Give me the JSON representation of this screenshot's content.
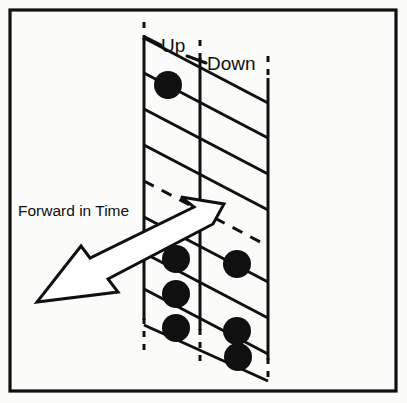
{
  "figure": {
    "name": "spin-network-forward-in-time-diagram",
    "background_color": "#fbfbf9",
    "ink_color": "#101010",
    "frame": {
      "label": "outer-border",
      "x": 10,
      "y": 10,
      "width": 386,
      "height": 381,
      "stroke_width": 3.2
    },
    "labels": {
      "up": "Up",
      "down": "Down",
      "forward_in_time": "Forward in Time"
    },
    "label_positions": {
      "up": {
        "x": 161,
        "y": 52,
        "font_size": 19
      },
      "down": {
        "x": 207,
        "y": 70,
        "font_size": 19
      },
      "forward_in_time": {
        "x": 18,
        "y": 216,
        "font_size": 15
      }
    },
    "leader_lines": [
      {
        "name": "up-leader",
        "x1": 160,
        "y1": 44,
        "x2": 145,
        "y2": 38
      },
      {
        "name": "down-leader",
        "x1": 205,
        "y1": 62,
        "x2": 186,
        "y2": 56
      }
    ],
    "vertical_lines": [
      {
        "name": "vertical-line-left",
        "x": 144,
        "dash_top": {
          "y1": 22,
          "y2": 38
        },
        "solid": {
          "y1": 38,
          "y2": 320
        },
        "dash_bottom": {
          "y1": 320,
          "y2": 350
        }
      },
      {
        "name": "vertical-line-middle",
        "x": 200,
        "dash_top": {
          "y1": 40,
          "y2": 58
        },
        "solid": {
          "y1": 58,
          "y2": 330
        },
        "dash_bottom": {
          "y1": 330,
          "y2": 367
        }
      },
      {
        "name": "vertical-line-right",
        "x": 268,
        "dash_top": {
          "y1": 56,
          "y2": 78
        },
        "solid": {
          "y1": 78,
          "y2": 360
        },
        "dash_bottom": {
          "y1": 360,
          "y2": 381
        }
      }
    ],
    "diagonal_lines": [
      {
        "name": "diagonal-1",
        "x1": 144,
        "y1": 38,
        "x2": 268,
        "y2": 103,
        "style": "solid"
      },
      {
        "name": "diagonal-2",
        "x1": 144,
        "y1": 73,
        "x2": 268,
        "y2": 138,
        "style": "solid"
      },
      {
        "name": "diagonal-3",
        "x1": 144,
        "y1": 109,
        "x2": 268,
        "y2": 174,
        "style": "solid"
      },
      {
        "name": "diagonal-4",
        "x1": 144,
        "y1": 145,
        "x2": 268,
        "y2": 210,
        "style": "solid"
      },
      {
        "name": "diagonal-5",
        "x1": 144,
        "y1": 181,
        "x2": 268,
        "y2": 246,
        "style": "dashed"
      },
      {
        "name": "diagonal-6",
        "x1": 144,
        "y1": 217,
        "x2": 268,
        "y2": 282,
        "style": "solid"
      },
      {
        "name": "diagonal-7",
        "x1": 144,
        "y1": 253,
        "x2": 268,
        "y2": 318,
        "style": "solid"
      },
      {
        "name": "diagonal-8",
        "x1": 144,
        "y1": 289,
        "x2": 268,
        "y2": 354,
        "style": "solid"
      },
      {
        "name": "diagonal-9",
        "x1": 144,
        "y1": 325,
        "x2": 268,
        "y2": 381,
        "style": "solid"
      }
    ],
    "dots": [
      {
        "name": "dot-up-top",
        "column": "Up",
        "cx": 168,
        "cy": 85,
        "r": 14
      },
      {
        "name": "dot-up-row1",
        "column": "Up",
        "cx": 176,
        "cy": 259,
        "r": 14
      },
      {
        "name": "dot-down-row1",
        "column": "Down",
        "cx": 237,
        "cy": 264,
        "r": 14
      },
      {
        "name": "dot-up-row2",
        "column": "Up",
        "cx": 176,
        "cy": 294,
        "r": 14
      },
      {
        "name": "dot-up-row3",
        "column": "Up",
        "cx": 176,
        "cy": 328,
        "r": 14
      },
      {
        "name": "dot-down-row3",
        "column": "Down",
        "cx": 237,
        "cy": 331,
        "r": 14
      },
      {
        "name": "dot-down-row4",
        "column": "Down",
        "cx": 238,
        "cy": 357,
        "r": 14
      }
    ],
    "arrow": {
      "name": "forward-in-time-arrow",
      "fill": "#ffffff",
      "stroke": "#101010",
      "stroke_width": 3,
      "direction": "down-left",
      "tail": {
        "x": 224,
        "y": 206
      },
      "head_tip": {
        "x": 37,
        "y": 302
      },
      "outline_points": "181 197, 224 204, 213 224, 108 279, 118 292, 37 302, 81 246, 90 258, 194 207"
    }
  }
}
